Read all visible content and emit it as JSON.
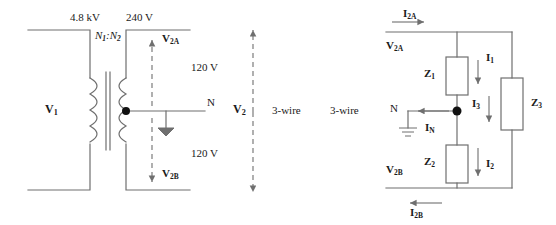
{
  "diagram": {
    "stroke_color": "#6f6f6f",
    "text_color": "#1a1a1a",
    "source_side": {
      "primary_voltage_label": "V",
      "primary_voltage_sub": "1",
      "primary_rating": "4.8 kV",
      "secondary_rating": "240 V",
      "turns_ratio": "N",
      "turns_ratio_sub1": "1",
      "turns_ratio_colon": ":",
      "turns_ratio_n2": "N",
      "turns_ratio_sub2": "2",
      "upper_half_voltage": "120 V",
      "lower_half_voltage": "120 V",
      "upper_arrow_label": "V",
      "upper_arrow_sub": "2A",
      "lower_arrow_label": "V",
      "lower_arrow_sub": "2B",
      "neutral_label": "N",
      "total_arrow_label": "V",
      "total_arrow_sub": "2",
      "wire_label_left": "3-wire",
      "wire_label_right": "3-wire"
    },
    "load_side": {
      "top_current": "I",
      "top_current_sub": "2A",
      "top_voltage": "V",
      "top_voltage_sub": "2A",
      "bottom_current": "I",
      "bottom_current_sub": "2B",
      "bottom_voltage": "V",
      "bottom_voltage_sub": "2B",
      "neutral_label": "N",
      "neutral_current": "I",
      "neutral_current_sub": "N",
      "impedances": [
        {
          "name": "Z",
          "sub": "1",
          "current": "I",
          "current_sub": "1"
        },
        {
          "name": "Z",
          "sub": "2",
          "current": "I",
          "current_sub": "2"
        },
        {
          "name": "Z",
          "sub": "3",
          "current": "I",
          "current_sub": "3"
        }
      ]
    }
  }
}
